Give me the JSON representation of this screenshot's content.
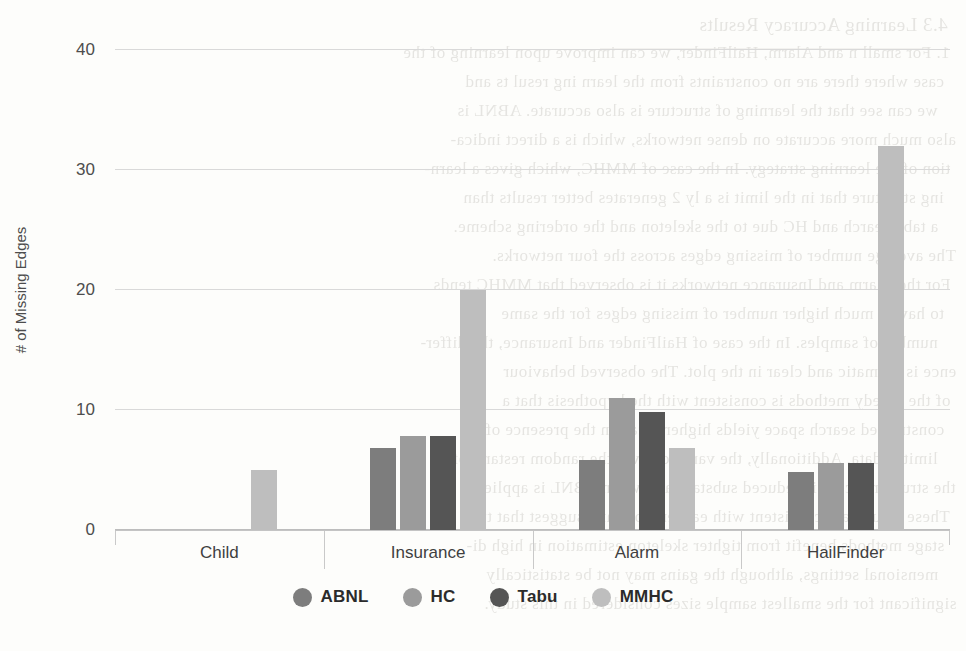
{
  "chart_data": {
    "type": "bar",
    "title": "",
    "subtitle": "",
    "xlabel": "",
    "ylabel": "# of Missing Edges",
    "categories": [
      "Child",
      "Insurance",
      "Alarm",
      "HailFinder"
    ],
    "series": [
      {
        "name": "ABNL",
        "color": "#7d7d7d",
        "values": [
          0,
          6.8,
          5.8,
          4.8
        ]
      },
      {
        "name": "HC",
        "color": "#9b9b9b",
        "values": [
          0,
          7.8,
          11.0,
          5.6
        ]
      },
      {
        "name": "Tabu",
        "color": "#555555",
        "values": [
          0,
          7.8,
          9.8,
          5.6
        ]
      },
      {
        "name": "MMHC",
        "color": "#bebebe",
        "values": [
          5.0,
          20.0,
          6.8,
          32.0
        ]
      }
    ],
    "ylim": [
      0,
      40
    ],
    "yticks": [
      0,
      10,
      20,
      30,
      40
    ],
    "ytick_labels": [
      "0",
      "10",
      "20",
      "30",
      "40"
    ],
    "grid": true,
    "legend_position": "bottom"
  },
  "axis": {
    "y_title": "# of Missing Edges",
    "y_tick_labels": [
      "40",
      "30",
      "20",
      "10",
      "0"
    ]
  },
  "legend": {
    "items": [
      {
        "label": "ABNL",
        "color": "#7d7d7d"
      },
      {
        "label": "HC",
        "color": "#9b9b9b"
      },
      {
        "label": "Tabu",
        "color": "#555555"
      },
      {
        "label": "MMHC",
        "color": "#bebebe"
      }
    ]
  },
  "background_ghost_text": {
    "lines": [
      "4.3   Learning Accuracy Results",
      "1.  For small n and Alarm, HailFinder, we can improve upon learning of the",
      "case where there are no constraints   from the   learn ing resul ts and",
      "we can see that the learning of   structure is also accurate. ABNL is",
      "also much more accurate on dense networks, which is a direct indica-",
      "tion of the learning strategy. In the case of MMHC, which gives a learn-",
      "ing structure that in the limit is  a  ly  2 generates  better  results  than",
      "a tabu search  and HC due to  the   skeleton   and   the ordering  scheme.",
      "The average number of  missing edges  across   the   four  networks.",
      "For the Alarm and Insurance networks  it is observed that MMHC  tends",
      "to have a much higher  number  of   missing   edges   for   the   same",
      "number of samples. In the case of  HailFinder and Insurance,  the  differ-",
      "ence is dramatic and clear  in   the   plot.   The   observed   behaviour",
      "of the greedy methods is consistent   with   the   hypothesis   that   a",
      "constrained search space yields   higher   recall   in   the   presence   of",
      "limited data. Additionally, the variance over  the   random   restarts   of",
      "the structure score is reduced substantially  when   ABNL   is   applied.",
      "These results are consistent with earlier  work and  suggest  that  two",
      "stage methods benefit from tighter  skeleton  estimation  in  high  di-",
      "mensional settings, although  the gains  may  not  be  statistically",
      "significant for the smallest sample sizes considered  in   this  study."
    ]
  }
}
